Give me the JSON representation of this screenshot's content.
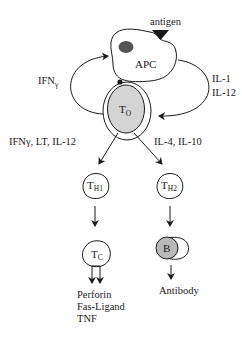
{
  "diagram": {
    "antigen_label": "antigen",
    "apc_label": "APC",
    "t0": {
      "main": "T",
      "sub": "O"
    },
    "left_loop_label": {
      "main": "IFN",
      "greek": "γ"
    },
    "right_loop_labels": [
      "IL-1",
      "IL-12"
    ],
    "left_branch_label": "IFNγ, LT, IL-12",
    "right_branch_label": "IL-4, IL-10",
    "th1": {
      "main": "T",
      "sub": "H",
      "subsub": "1"
    },
    "th2": {
      "main": "T",
      "sub": "H",
      "subsub": "2"
    },
    "tc": {
      "main": "T",
      "sub": "C"
    },
    "b_cell_label": "B",
    "tc_products": [
      "Perforin",
      "Fas-Ligand",
      "TNF"
    ],
    "b_product": "Antibody",
    "colors": {
      "ink": "#1a1a1a",
      "cell_fill": "#d4d4d4",
      "nucleus_fill": "#555555",
      "background": "#ffffff"
    }
  }
}
